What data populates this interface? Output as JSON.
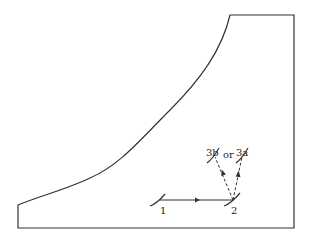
{
  "diagram": {
    "colors": {
      "stroke": "#333333",
      "background": "#ffffff"
    },
    "nodes": [
      {
        "id": "1",
        "label": "1"
      },
      {
        "id": "2",
        "label": "2"
      },
      {
        "id": "3b",
        "label": "3b"
      },
      {
        "id": "3a",
        "label": "3a"
      }
    ],
    "connector_label": "or",
    "edges": [
      {
        "from": "1",
        "to": "2",
        "style": "solid"
      },
      {
        "from": "2",
        "to": "3b",
        "style": "dashed"
      },
      {
        "from": "2",
        "to": "3a",
        "style": "dashed"
      }
    ]
  }
}
